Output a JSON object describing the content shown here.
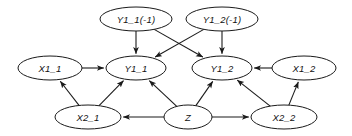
{
  "diagram": {
    "type": "directed-graph",
    "background_color": "#ffffff",
    "stroke_color": "#1a1a1a",
    "label_color": "#111111",
    "nodes": [
      {
        "id": "Y1_1_lag",
        "label": "Y1_1(-1)",
        "cx": 136,
        "cy": 19,
        "rx": 36,
        "ry": 12
      },
      {
        "id": "Y1_2_lag",
        "label": "Y1_2(-1)",
        "cx": 222,
        "cy": 19,
        "rx": 36,
        "ry": 12
      },
      {
        "id": "X1_1",
        "label": "X1_1",
        "cx": 50,
        "cy": 68,
        "rx": 32,
        "ry": 12
      },
      {
        "id": "Y1_1",
        "label": "Y1_1",
        "cx": 136,
        "cy": 68,
        "rx": 30,
        "ry": 12
      },
      {
        "id": "Y1_2",
        "label": "Y1_2",
        "cx": 222,
        "cy": 68,
        "rx": 30,
        "ry": 12
      },
      {
        "id": "X1_2",
        "label": "X1_2",
        "cx": 304,
        "cy": 68,
        "rx": 32,
        "ry": 12
      },
      {
        "id": "X2_1",
        "label": "X2_1",
        "cx": 88,
        "cy": 117,
        "rx": 33,
        "ry": 12
      },
      {
        "id": "Z",
        "label": "Z",
        "cx": 188,
        "cy": 117,
        "rx": 24,
        "ry": 12
      },
      {
        "id": "X2_2",
        "label": "X2_2",
        "cx": 284,
        "cy": 117,
        "rx": 33,
        "ry": 12
      }
    ],
    "edges": [
      {
        "from": "Y1_1_lag",
        "to": "Y1_1",
        "arrow": "single"
      },
      {
        "from": "Y1_1_lag",
        "to": "Y1_2",
        "arrow": "single"
      },
      {
        "from": "Y1_2_lag",
        "to": "Y1_2",
        "arrow": "single"
      },
      {
        "from": "Y1_2_lag",
        "to": "Y1_1",
        "arrow": "single"
      },
      {
        "from": "X1_1",
        "to": "Y1_1",
        "arrow": "single"
      },
      {
        "from": "X1_2",
        "to": "Y1_2",
        "arrow": "single"
      },
      {
        "from": "X2_1",
        "to": "X1_1",
        "arrow": "single"
      },
      {
        "from": "X2_1",
        "to": "Y1_1",
        "arrow": "single"
      },
      {
        "from": "X2_2",
        "to": "X1_2",
        "arrow": "single"
      },
      {
        "from": "X2_2",
        "to": "Y1_2",
        "arrow": "single"
      },
      {
        "from": "Z",
        "to": "Y1_1",
        "arrow": "single"
      },
      {
        "from": "Z",
        "to": "Y1_2",
        "arrow": "single"
      },
      {
        "from": "Z",
        "to": "X2_1",
        "arrow": "single"
      },
      {
        "from": "Z",
        "to": "X2_2",
        "arrow": "single"
      }
    ]
  }
}
